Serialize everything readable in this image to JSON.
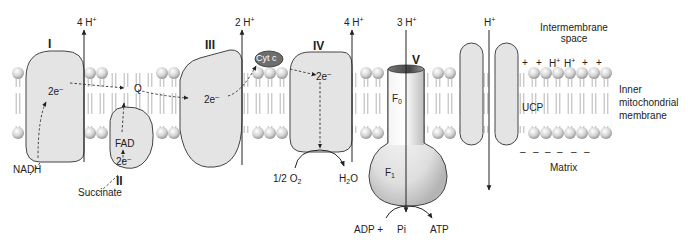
{
  "figure": {
    "colors": {
      "protein_fill": "#e4e4e4",
      "protein_stroke": "#444444",
      "lipid_head": "#d8d8d8",
      "cyt_c_fill": "#6e6e6e",
      "text": "#222222"
    }
  },
  "regions": {
    "intermembrane_space": [
      "Intermembrane",
      "space"
    ],
    "membrane": [
      "Inner",
      "mitochondrial",
      "membrane"
    ],
    "matrix": "Matrix"
  },
  "complexes": [
    {
      "id": "I",
      "label": "I",
      "proton_pump": "4 H+",
      "pumped_count": "4"
    },
    {
      "id": "II",
      "label": "II"
    },
    {
      "id": "III",
      "label": "III",
      "proton_pump": "2 H+",
      "pumped_count": "2"
    },
    {
      "id": "IV",
      "label": "IV",
      "proton_pump": "4 H+",
      "pumped_count": "4"
    },
    {
      "id": "V",
      "label": "V",
      "proton_pump": "3 H+",
      "pumped_count": "3"
    }
  ],
  "carriers": {
    "q": "Q",
    "cyt_c": "Cyt c",
    "fad": "FAD"
  },
  "electrons": {
    "e1": "2e",
    "e2": "2e",
    "e3": "2e",
    "e4": "2e"
  },
  "substrates": {
    "nadh": "NADH",
    "succinate": "Succinate",
    "o2_prefix": "1/2 O",
    "o2_sub": "2",
    "h2o_h": "H",
    "h2o_sub": "2",
    "h2o_o": "O",
    "adp": "ADP +",
    "pi": "Pi",
    "atp": "ATP"
  },
  "atp_synthase": {
    "f0": "F",
    "f0_sub": "0",
    "f1": "F",
    "f1_sub": "1"
  },
  "ucp": {
    "label": "UCP",
    "proton": "H"
  },
  "charges": {
    "plus_row": [
      "+",
      "+",
      "H+",
      "H+",
      "+",
      "+"
    ],
    "minus_row": [
      "–",
      "–",
      "–",
      "–",
      "–",
      "–"
    ]
  },
  "h_symbol": "H",
  "plus_sup": "+",
  "minus_sup": "–"
}
